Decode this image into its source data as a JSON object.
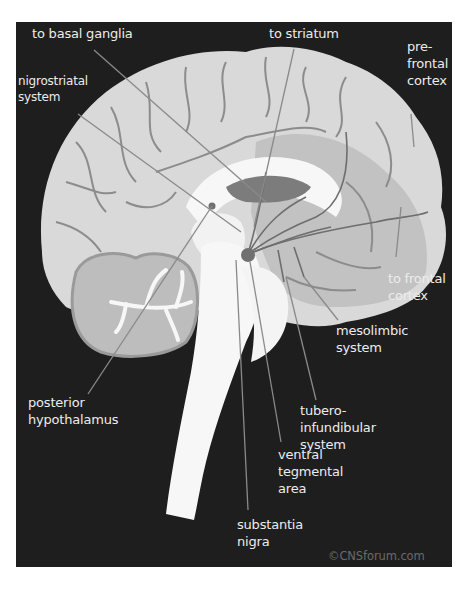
{
  "diagram": {
    "colors": {
      "background": "#1e1e1e",
      "cortex": "#d9d9d9",
      "inner_region": "#bdbdbd",
      "limbic_dark": "#7c7c7c",
      "white_matter": "#f7f7f7",
      "pathway_lines": "#6e6e6e",
      "label_text": "#ececec"
    },
    "labels": {
      "basal_ganglia": "to basal ganglia",
      "striatum": "to striatum",
      "prefrontal": "pre-\nfrontal\ncortex",
      "nigrostriatal": "nigrostriatal\nsystem",
      "frontal_cortex": "to frontal\ncortex",
      "mesolimbic": "mesolimbic\nsystem",
      "tuberoinfundibular": "tubero-\ninfundibular\nsystem",
      "posterior_hypothalamus": "posterior\nhypothalamus",
      "ventral_tegmental": "ventral\ntegmental\narea",
      "substantia_nigra": "substantia\nnigra"
    },
    "watermark": "©CNSforum.com"
  }
}
